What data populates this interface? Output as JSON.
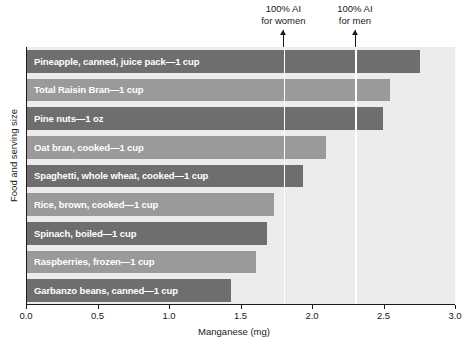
{
  "chart_data": {
    "type": "bar",
    "orientation": "horizontal",
    "title": "",
    "xlabel": "Manganese (mg)",
    "ylabel": "Food and serving size",
    "xlim": [
      0.0,
      3.0
    ],
    "xticks": [
      "0.0",
      "0.5",
      "1.0",
      "1.5",
      "2.0",
      "2.5",
      "3.0"
    ],
    "xtick_values": [
      0.0,
      0.5,
      1.0,
      1.5,
      2.0,
      2.5,
      3.0
    ],
    "grid": false,
    "legend": "none",
    "categories": [
      "Pineapple, canned, juice pack—1 cup",
      "Total Raisin Bran—1 cup",
      "Pine nuts—1 oz",
      "Oat bran, cooked—1 cup",
      "Spaghetti, whole wheat, cooked—1 cup",
      "Rice, brown, cooked—1 cup",
      "Spinach, boiled—1 cup",
      "Raspberries, frozen—1 cup",
      "Garbanzo beans, canned—1 cup"
    ],
    "values": [
      2.75,
      2.54,
      2.49,
      2.09,
      1.93,
      1.73,
      1.68,
      1.6,
      1.43
    ],
    "annotations": [
      {
        "label_line1": "100% AI",
        "label_line2": "for women",
        "value": 1.8
      },
      {
        "label_line1": "100% AI",
        "label_line2": "for men",
        "value": 2.3
      }
    ]
  },
  "colors": {
    "bar_dark": "#6e6e6e",
    "bar_light": "#9a9a9a",
    "plot_background": "#ececed",
    "axis": "#1a1a1a",
    "reference_line": "#ffffff",
    "bar_label_text": "#ffffff"
  }
}
